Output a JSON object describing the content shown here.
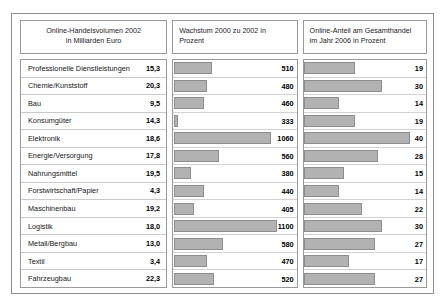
{
  "headers": {
    "volume": {
      "line1": "Online-Handelsvolumen 2002",
      "line2": "in Milliarden Euro"
    },
    "growth": {
      "line1": "Wachstum 2000 zu 2002 in",
      "line2": "Prozent"
    },
    "share": {
      "line1": "Online-Anteil am Gesamthandel",
      "line2": "im Jahr 2006 in Prozent"
    }
  },
  "chart_data": {
    "type": "bar",
    "title": "",
    "xlabel": "",
    "ylabel": "",
    "grid": false,
    "legend": "none",
    "categories": [
      "Professionelle Dienstleistungen",
      "Chemie/Kunststoff",
      "Bau",
      "Konsumgüter",
      "Elektronik",
      "Energie/Versorgung",
      "Nahrungsmittel",
      "Forstwirtschaft/Papier",
      "Maschinenbau",
      "Logistik",
      "Metall/Bergbau",
      "Textil",
      "Fahrzeugbau"
    ],
    "series": [
      {
        "name": "Online-Handelsvolumen 2002 in Milliarden Euro",
        "unit": "Mrd. Euro",
        "display": "text",
        "values": [
          "15,3",
          "20,3",
          "9,5",
          "14,3",
          "18,6",
          "17,8",
          "19,5",
          "4,3",
          "19,2",
          "18,0",
          "13,0",
          "3,4",
          "22,3"
        ]
      },
      {
        "name": "Wachstum 2000 zu 2002 in Prozent",
        "unit": "%",
        "display": "bar",
        "xlim": [
          0,
          1100
        ],
        "values": [
          510,
          480,
          460,
          333,
          1060,
          560,
          380,
          440,
          405,
          1100,
          580,
          470,
          520
        ],
        "bar_px": [
          38,
          33,
          30,
          4,
          97,
          45,
          17,
          30,
          20,
          103,
          49,
          33,
          40
        ]
      },
      {
        "name": "Online-Anteil am Gesamthandel im Jahr 2006 in Prozent",
        "unit": "%",
        "display": "bar",
        "xlim": [
          0,
          40
        ],
        "values": [
          19,
          30,
          14,
          19,
          40,
          28,
          15,
          14,
          22,
          30,
          27,
          17,
          27
        ],
        "bar_px": [
          51,
          78,
          35,
          51,
          106,
          74,
          40,
          35,
          58,
          78,
          71,
          45,
          71
        ]
      }
    ]
  },
  "colors": {
    "bar_fill": "#b2b2b2",
    "bar_stroke": "#8d8d8d",
    "frame": "#8e8e8e",
    "row_divider": "#c9c9c9",
    "text": "#161616",
    "background": "#ffffff"
  }
}
